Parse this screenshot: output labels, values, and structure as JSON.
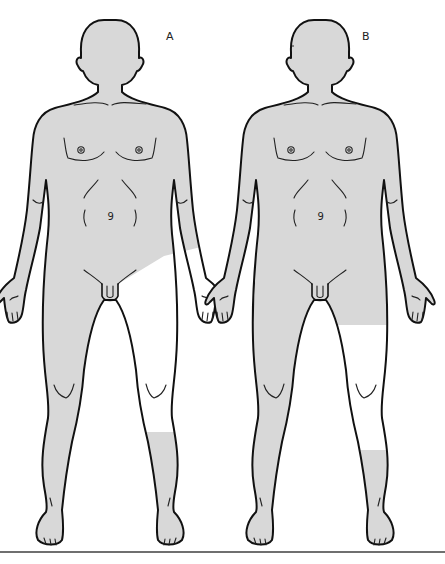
{
  "figures": [
    {
      "label": "A",
      "description": "Anterior view; shaded body with unshaded region over right-side (viewer's right) groin, thigh and knee down to mid-shin",
      "shaded_color": "#d8d8d8",
      "unshaded_color": "#ffffff",
      "shading_regions": [
        "head",
        "neck",
        "trunk",
        "both arms",
        "both hands",
        "left leg (viewer's left)",
        "lower shin and foot (viewer's right)"
      ],
      "unshaded_regions": [
        "lower abdomen/groin diagonal to thigh, thigh, knee and upper shin (viewer's right)"
      ]
    },
    {
      "label": "B",
      "description": "Anterior view; shaded body with unshaded region from mid-thigh to mid-shin on viewer's right leg",
      "shaded_color": "#d8d8d8",
      "unshaded_color": "#ffffff",
      "shading_regions": [
        "head",
        "neck",
        "trunk",
        "both arms",
        "both hands",
        "left leg (viewer's left)",
        "upper thigh and lower shin/foot (viewer's right)"
      ],
      "unshaded_regions": [
        "lower thigh, knee and upper-mid shin (viewer's right)"
      ]
    }
  ],
  "colors": {
    "outline": "#111111",
    "shade": "#d8d8d8",
    "background": "#ffffff",
    "divider": "#6f6f6f"
  }
}
